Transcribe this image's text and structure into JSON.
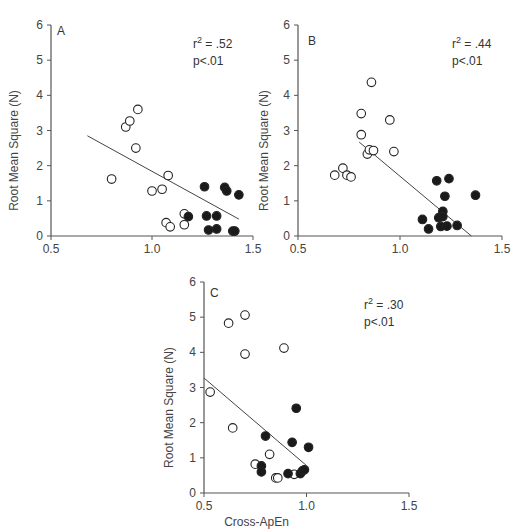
{
  "chart_data": [
    {
      "type": "scatter",
      "panel": "A",
      "title": "",
      "xlabel": "",
      "ylabel": "Root Mean Square (N)",
      "xlim": [
        0.5,
        1.5
      ],
      "ylim": [
        0,
        6
      ],
      "xticks": [
        "0.5",
        "1.0",
        "1.5"
      ],
      "yticks": [
        "0",
        "1",
        "2",
        "3",
        "4",
        "5",
        "6"
      ],
      "grid": false,
      "annotation": {
        "r2": "r² = .52",
        "r2_base": "r",
        "r2_sup": "2",
        "r2_value": " = .52",
        "p": "p<.01"
      },
      "series": [
        {
          "name": "open",
          "marker": "open-circle",
          "points": [
            [
              0.8,
              1.62
            ],
            [
              0.87,
              3.1
            ],
            [
              0.89,
              3.27
            ],
            [
              0.93,
              3.6
            ],
            [
              0.92,
              2.5
            ],
            [
              1.0,
              1.28
            ],
            [
              1.05,
              1.33
            ],
            [
              1.08,
              1.72
            ],
            [
              1.07,
              0.38
            ],
            [
              1.09,
              0.26
            ],
            [
              1.16,
              0.63
            ],
            [
              1.16,
              0.32
            ]
          ]
        },
        {
          "name": "filled",
          "marker": "filled-circle",
          "points": [
            [
              1.18,
              0.55
            ],
            [
              1.26,
              1.4
            ],
            [
              1.27,
              0.57
            ],
            [
              1.32,
              0.57
            ],
            [
              1.28,
              0.17
            ],
            [
              1.32,
              0.2
            ],
            [
              1.36,
              1.38
            ],
            [
              1.37,
              1.28
            ],
            [
              1.43,
              1.17
            ],
            [
              1.4,
              0.14
            ],
            [
              1.41,
              0.14
            ]
          ]
        }
      ],
      "regression_line": [
        [
          0.68,
          2.85
        ],
        [
          1.43,
          0.48
        ]
      ]
    },
    {
      "type": "scatter",
      "panel": "B",
      "title": "",
      "xlabel": "",
      "ylabel": "Root Mean Square (N)",
      "xlim": [
        0.5,
        1.5
      ],
      "ylim": [
        0,
        6
      ],
      "xticks": [
        "0.5",
        "1.0",
        "1.5"
      ],
      "yticks": [
        "0",
        "1",
        "2",
        "3",
        "4",
        "5",
        "6"
      ],
      "grid": false,
      "annotation": {
        "r2": "r² = .44",
        "r2_base": "r",
        "r2_sup": "2",
        "r2_value": " = .44",
        "p": "p<.01"
      },
      "series": [
        {
          "name": "open",
          "marker": "open-circle",
          "points": [
            [
              0.68,
              1.73
            ],
            [
              0.72,
              1.93
            ],
            [
              0.74,
              1.73
            ],
            [
              0.76,
              1.68
            ],
            [
              0.81,
              3.48
            ],
            [
              0.81,
              2.88
            ],
            [
              0.86,
              4.37
            ],
            [
              0.84,
              2.33
            ],
            [
              0.85,
              2.45
            ],
            [
              0.87,
              2.43
            ],
            [
              0.95,
              3.3
            ],
            [
              0.97,
              2.4
            ]
          ]
        },
        {
          "name": "filled",
          "marker": "filled-circle",
          "points": [
            [
              1.11,
              0.47
            ],
            [
              1.14,
              0.2
            ],
            [
              1.18,
              1.57
            ],
            [
              1.19,
              0.52
            ],
            [
              1.2,
              0.27
            ],
            [
              1.21,
              0.7
            ],
            [
              1.21,
              0.55
            ],
            [
              1.22,
              1.13
            ],
            [
              1.23,
              0.28
            ],
            [
              1.24,
              1.63
            ],
            [
              1.28,
              0.3
            ],
            [
              1.37,
              1.16
            ]
          ]
        }
      ],
      "regression_line": [
        [
          0.8,
          2.67
        ],
        [
          1.35,
          0.0
        ]
      ]
    },
    {
      "type": "scatter",
      "panel": "C",
      "title": "",
      "xlabel": "Cross-ApEn",
      "ylabel": "Root Mean Square (N)",
      "xlim": [
        0.5,
        1.5
      ],
      "ylim": [
        0,
        6
      ],
      "xticks": [
        "0.5",
        "1.0",
        "1.5"
      ],
      "yticks": [
        "0",
        "1",
        "2",
        "3",
        "4",
        "5",
        "6"
      ],
      "grid": false,
      "annotation": {
        "r2": "r² = .30",
        "r2_base": "r",
        "r2_sup": "2",
        "r2_value": " = .30",
        "p": "p<.01"
      },
      "series": [
        {
          "name": "open",
          "marker": "open-circle",
          "points": [
            [
              0.53,
              2.87
            ],
            [
              0.62,
              4.83
            ],
            [
              0.7,
              5.06
            ],
            [
              0.7,
              3.95
            ],
            [
              0.64,
              1.85
            ],
            [
              0.89,
              4.12
            ],
            [
              0.82,
              1.1
            ],
            [
              0.75,
              0.82
            ],
            [
              0.85,
              0.43
            ],
            [
              0.86,
              0.43
            ],
            [
              0.94,
              0.53
            ]
          ]
        },
        {
          "name": "filled",
          "marker": "filled-circle",
          "points": [
            [
              0.78,
              0.77
            ],
            [
              0.78,
              0.6
            ],
            [
              0.8,
              1.62
            ],
            [
              0.91,
              0.55
            ],
            [
              0.93,
              1.44
            ],
            [
              0.95,
              2.41
            ],
            [
              0.97,
              0.55
            ],
            [
              0.98,
              0.63
            ],
            [
              0.99,
              0.66
            ],
            [
              1.01,
              1.3
            ]
          ]
        }
      ],
      "regression_line": [
        [
          0.5,
          3.27
        ],
        [
          1.0,
          0.78
        ]
      ]
    }
  ],
  "panels": [
    {
      "letter": "A",
      "ylabel": "Root Mean Square (N)",
      "xlabel": "",
      "r2_text": "r",
      "r2_sup": "2",
      "r2_value": " = .52",
      "p_text": "p<.01"
    },
    {
      "letter": "B",
      "ylabel": "Root Mean Square (N)",
      "xlabel": "",
      "r2_text": "r",
      "r2_sup": "2",
      "r2_value": " = .44",
      "p_text": "p<.01"
    },
    {
      "letter": "C",
      "ylabel": "Root Mean Square (N)",
      "xlabel": "Cross-ApEn",
      "r2_text": "r",
      "r2_sup": "2",
      "r2_value": " = .30",
      "p_text": "p<.01"
    }
  ],
  "colors": {
    "axis": "#555555",
    "marker_stroke": "#222222",
    "marker_fill": "#1a1a1a",
    "line": "#444444",
    "text": "#333333"
  }
}
